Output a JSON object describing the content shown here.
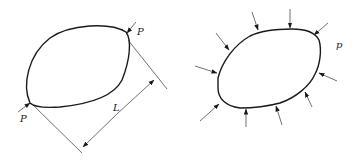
{
  "figure": {
    "left": {
      "description": "Closed ring loaded by two opposing point forces P, separated by distance L",
      "labels": {
        "force_top": "P",
        "force_bottom": "P",
        "dimension": "L"
      }
    },
    "right": {
      "description": "Closed ring loaded by uniform external pressure p",
      "labels": {
        "pressure": "p"
      },
      "arrow_count": 10
    },
    "colors": {
      "stroke": "#1a1a1a",
      "background": "#ffffff"
    }
  }
}
